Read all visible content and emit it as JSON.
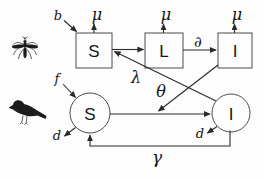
{
  "diagram_type": "compartmental-epidemic-model",
  "colors": {
    "background": "#fdfdfd",
    "stroke": "#2b2b2b",
    "shape_border": "#4d4d4d",
    "text": "#141414"
  },
  "mosquito_section": {
    "icon": "mosquito",
    "compartments": [
      {
        "label": "S",
        "shape": "square"
      },
      {
        "label": "L",
        "shape": "square"
      },
      {
        "label": "I",
        "shape": "square"
      }
    ],
    "birth_rate_label": "b",
    "death_rate_labels": [
      "μ",
      "μ",
      "μ"
    ],
    "latency_flow_label": "∂",
    "infection_flow_label": "λ"
  },
  "bird_section": {
    "icon": "bird",
    "compartments": [
      {
        "label": "S",
        "shape": "circle"
      },
      {
        "label": "I",
        "shape": "circle"
      }
    ],
    "birth_rate_label": "f",
    "death_rate_labels": [
      "d",
      "d"
    ],
    "infection_flow_label": "θ",
    "recovery_flow_label": "γ"
  }
}
